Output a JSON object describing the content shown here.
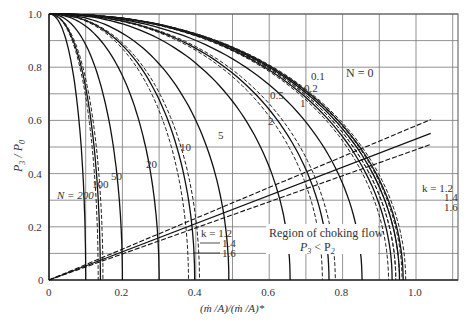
{
  "chart_data": {
    "type": "line",
    "title": "",
    "xlabel": "(ṁ /A)/(ṁ /A)*",
    "ylabel": "P3 / P0",
    "xlim": [
      0,
      1.1
    ],
    "ylim": [
      0,
      1.0
    ],
    "grid": true,
    "x_ticks": [
      "0",
      "0.2",
      "0.4",
      "0.6",
      "0.8",
      "1.0"
    ],
    "x_tick_values": [
      0,
      0.2,
      0.4,
      0.6,
      0.8,
      1.0
    ],
    "y_ticks": [
      "0",
      "0.2",
      "0.4",
      "0.6",
      "0.8",
      "1.0"
    ],
    "y_tick_values": [
      0,
      0.2,
      0.4,
      0.6,
      0.8,
      1.0
    ],
    "curve_family_label": "N",
    "curves": [
      {
        "N": "0",
        "label": "N = 0",
        "choke_x": 0.965,
        "choke_y": 0.53,
        "k_variants": [
          0.955,
          0.965,
          0.972
        ]
      },
      {
        "N": "0.1",
        "label": "0.1",
        "choke_x": 0.955,
        "choke_y": 0.53,
        "k_variants": [
          0.945,
          0.955,
          0.962
        ]
      },
      {
        "N": "0.2",
        "label": "0.2",
        "choke_x": 0.935,
        "choke_y": 0.52,
        "k_variants": [
          0.925,
          0.935,
          0.945
        ]
      },
      {
        "N": "0.5",
        "label": "0.5",
        "choke_x": 0.853,
        "choke_y": 0.47
      },
      {
        "N": "1",
        "label": "1",
        "choke_x": 0.763,
        "choke_y": 0.42,
        "k_variants": [
          0.745,
          0.763,
          0.78
        ]
      },
      {
        "N": "2",
        "label": "2",
        "choke_x": 0.657,
        "choke_y": 0.36
      },
      {
        "N": "5",
        "label": "5",
        "choke_x": 0.49,
        "choke_y": 0.27
      },
      {
        "N": "10",
        "label": "10",
        "choke_x": 0.397,
        "choke_y": 0.22,
        "k_variants": [
          0.38,
          0.397,
          0.41
        ]
      },
      {
        "N": "20",
        "label": "20",
        "choke_x": 0.3,
        "choke_y": 0.165
      },
      {
        "N": "50",
        "label": "50",
        "choke_x": 0.2,
        "choke_y": 0.11
      },
      {
        "N": "100",
        "label": "100",
        "choke_x": 0.14,
        "choke_y": 0.08,
        "k_variants": [
          0.134,
          0.14,
          0.147
        ]
      },
      {
        "N": "200",
        "label": "N = 200",
        "choke_x": 0.1,
        "choke_y": 0.055
      }
    ],
    "choking_lines": [
      {
        "k": "1.2",
        "label": "k = 1.2",
        "slope": 0.58,
        "style": "dashed"
      },
      {
        "k": "1.4",
        "label": "1.4",
        "slope": 0.53,
        "style": "solid"
      },
      {
        "k": "1.6",
        "label": "1.6",
        "slope": 0.49,
        "style": "dashed"
      }
    ],
    "annotations": [
      {
        "text": "Region of choking flow",
        "x": 0.69,
        "y": 0.16
      },
      {
        "text": "P3 < P2",
        "x": 0.72,
        "y": 0.11
      }
    ],
    "series_styles": {
      "k=1.4": "solid",
      "k=1.2": "dashed",
      "k=1.6": "dashed"
    }
  },
  "labels": {
    "x_axis": "(ṁ /A)/(ṁ /A)*",
    "y_axis_main": "P",
    "y_axis_sub3": "3",
    "y_axis_sep": " / ",
    "y_axis_p0": "P",
    "y_axis_sub0": "0",
    "region_line1": "Region of choking flow",
    "region_line2_a": "P",
    "region_line2_sub3": "3",
    "region_line2_mid": " < P",
    "region_line2_sub2": "2",
    "k_top_right": [
      "k = 1.2",
      "1.4",
      "1.6"
    ],
    "k_mid": [
      "k = 1.2",
      "1.4",
      "1.6"
    ],
    "n_labels": {
      "n0": "N = 0",
      "n01": "0.1",
      "n02": "0.2",
      "n05": "0.5",
      "n1": "1",
      "n2": "2",
      "n5": "5",
      "n10": "10",
      "n20": "20",
      "n50": "50",
      "n100": "100",
      "n200": "N = 200"
    }
  }
}
